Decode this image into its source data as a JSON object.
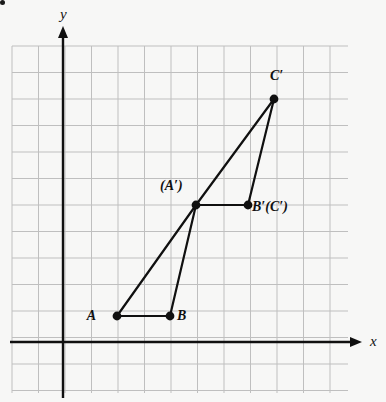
{
  "figure": {
    "background_color": "#f7f7f6",
    "corner_bullet": {
      "name": "list-bullet",
      "x": 6,
      "y": 8
    },
    "axes": {
      "x": {
        "label": "x",
        "label_x": 370,
        "label_y": 333,
        "pixel_y": 342,
        "start_x": 10,
        "end_x": 362,
        "color": "#101010",
        "arrow": "right"
      },
      "y": {
        "label": "y",
        "label_x": 60,
        "label_y": 6,
        "pixel_x": 63,
        "start_y": 398,
        "end_y": 26,
        "color": "#101010",
        "arrow": "up"
      },
      "origin_px": {
        "x": 63,
        "y": 342
      }
    },
    "grid": {
      "left": 12,
      "top": 46,
      "right": 348,
      "bottom": 393,
      "cell_size": 26.5,
      "columns": 13,
      "rows": 13,
      "line_color": "#bfbfbf",
      "visible": true
    },
    "style": {
      "segment_color": "#101010",
      "segment_width": 2.2,
      "point_color": "#101010",
      "point_radius": 4.4
    }
  },
  "chart_data": {
    "type": "scatter",
    "title": "",
    "xlabel": "x",
    "ylabel": "y",
    "grid": true,
    "legend": null,
    "unit_px": 26.5,
    "origin_px": {
      "x": 63,
      "y": 342
    },
    "points": [
      {
        "id": "A",
        "label": "A",
        "x": 2,
        "y": 1,
        "px": 117,
        "py": 316,
        "label_px": 96,
        "label_py": 308,
        "label_align": "right"
      },
      {
        "id": "B",
        "label": "B",
        "x": 4,
        "y": 1,
        "px": 170,
        "py": 316,
        "label_px": 177,
        "label_py": 308,
        "label_align": "left"
      },
      {
        "id": "Aprime",
        "label": "(A′)",
        "x": 5,
        "y": 5.2,
        "px": 196,
        "py": 205,
        "label_px": 160,
        "label_py": 178,
        "label_align": "left"
      },
      {
        "id": "Bprime",
        "label": "B′(C′)",
        "x": 7,
        "y": 5.2,
        "px": 248,
        "py": 205,
        "label_px": 252,
        "label_py": 199,
        "label_align": "left"
      },
      {
        "id": "Cprime",
        "label": "C′",
        "x": 8,
        "y": 9.2,
        "px": 274,
        "py": 99,
        "label_px": 270,
        "label_py": 68,
        "label_align": "left"
      }
    ],
    "segments": [
      {
        "name": "segment-A-B",
        "from": "A",
        "to": "B"
      },
      {
        "name": "segment-A-Aprime",
        "from": "A",
        "to": "Aprime"
      },
      {
        "name": "segment-B-Aprime",
        "from": "B",
        "to": "Aprime"
      },
      {
        "name": "segment-Aprime-Bprime",
        "from": "Aprime",
        "to": "Bprime"
      },
      {
        "name": "segment-Aprime-Cprime",
        "from": "Aprime",
        "to": "Cprime"
      },
      {
        "name": "segment-Bprime-Cprime",
        "from": "Bprime",
        "to": "Cprime"
      }
    ]
  }
}
